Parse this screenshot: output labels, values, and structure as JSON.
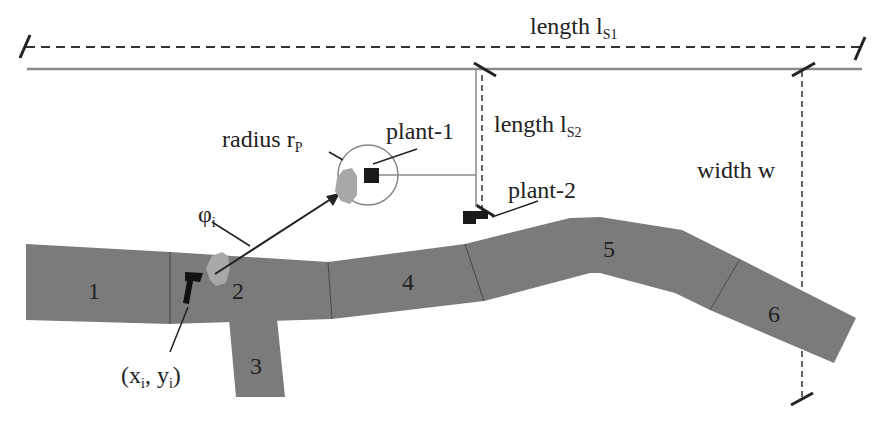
{
  "labels": {
    "length_s1": {
      "main": "length l",
      "sub": "S1"
    },
    "length_s2": {
      "main": "length l",
      "sub": "S2"
    },
    "width": "width w",
    "radius": {
      "main": "radius r",
      "sub": "P"
    },
    "plant1": "plant-1",
    "plant2": "plant-2",
    "phi": {
      "main": "φ",
      "sub": "i"
    },
    "coord": {
      "open": "(x",
      "sub1": "i",
      "mid": ", y",
      "sub2": "i",
      "close": ")"
    }
  },
  "segments": [
    {
      "id": "1",
      "label": "1"
    },
    {
      "id": "2",
      "label": "2"
    },
    {
      "id": "3",
      "label": "3"
    },
    {
      "id": "4",
      "label": "4"
    },
    {
      "id": "5",
      "label": "5"
    },
    {
      "id": "6",
      "label": "6"
    }
  ],
  "colors": {
    "road": "#7a7a7a",
    "road_edge": "#555555",
    "plant": "#1a1a1a",
    "cluster": "#a8a8a8",
    "line": "#222222",
    "guide": "#888888"
  }
}
